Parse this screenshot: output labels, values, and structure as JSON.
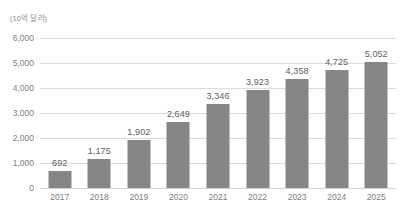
{
  "chart_data": {
    "type": "bar",
    "title": "",
    "subtitle": "",
    "unit_label": "(10억 달러)",
    "xlabel": "",
    "ylabel": "",
    "categories": [
      "2017",
      "2018",
      "2019",
      "2020",
      "2021",
      "2022",
      "2023",
      "2024",
      "2025"
    ],
    "values": [
      692,
      1175,
      1902,
      2649,
      3346,
      3923,
      4358,
      4725,
      5052
    ],
    "value_labels": [
      "692",
      "1,175",
      "1,902",
      "2,649",
      "3,346",
      "3,923",
      "4,358",
      "4,725",
      "5,052"
    ],
    "ylim": [
      0,
      6000
    ],
    "yticks": [
      0,
      1000,
      2000,
      3000,
      4000,
      5000,
      6000
    ],
    "ytick_labels": [
      "0",
      "1,000",
      "2,000",
      "3,000",
      "4,000",
      "5,000",
      "6,000"
    ],
    "grid": true,
    "legend": false,
    "legend_position": "none",
    "series": [
      {
        "name": "",
        "values": [
          692,
          1175,
          1902,
          2649,
          3346,
          3923,
          4358,
          4725,
          5052
        ]
      }
    ],
    "colors": {
      "bar": "#868686",
      "gridline": "#dcdcdc",
      "baseline": "#d2d2d2",
      "axis_text": "#808080",
      "value_text": "#5e5e5e",
      "unit_text": "#8c8c8c",
      "background": "#ffffff"
    }
  }
}
